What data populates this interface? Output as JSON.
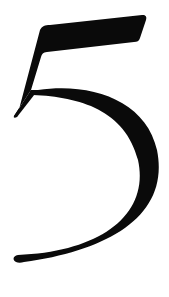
{
  "image": {
    "glyph": "5",
    "description": "Large black serif numeral five on white background",
    "colors": {
      "foreground": "#0a0a0a",
      "background": "#ffffff"
    }
  }
}
